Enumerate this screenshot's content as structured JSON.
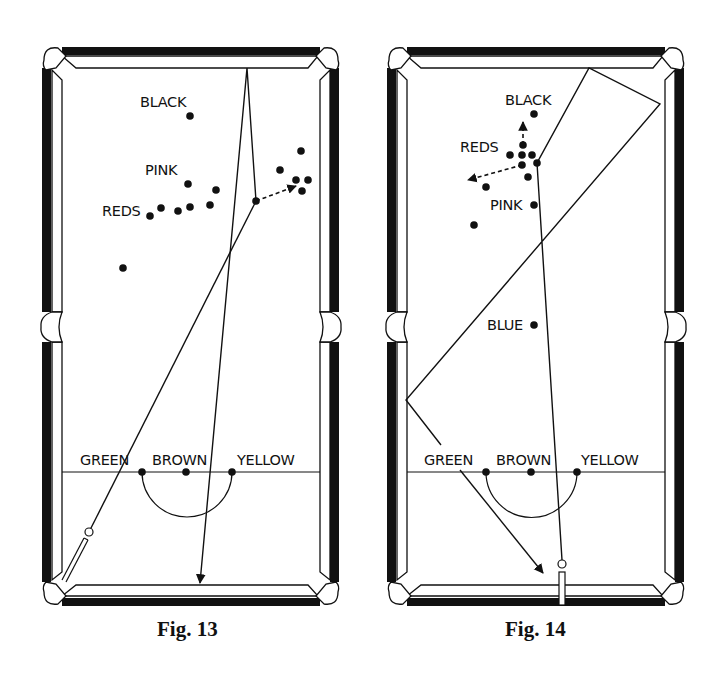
{
  "figures": [
    {
      "caption": "Fig. 13",
      "labels": {
        "black": "BLACK",
        "pink": "PINK",
        "reds": "REDS",
        "green": "GREEN",
        "brown": "BROWN",
        "yellow": "YELLOW"
      },
      "balls": {
        "black": [
          190,
          116
        ],
        "pink": [
          188,
          184
        ],
        "green": [
          142,
          472
        ],
        "brown": [
          186,
          472
        ],
        "yellow": [
          232,
          472
        ],
        "cue_contact": [
          256,
          201
        ],
        "reds": [
          [
            150,
            216
          ],
          [
            161,
            208
          ],
          [
            178,
            211
          ],
          [
            190,
            207
          ],
          [
            210,
            205
          ],
          [
            216,
            190
          ],
          [
            280,
            170
          ],
          [
            301,
            151
          ],
          [
            296,
            180
          ],
          [
            308,
            180
          ],
          [
            302,
            191
          ],
          [
            123,
            268
          ]
        ]
      },
      "cue_ball": [
        89,
        532
      ],
      "paths": {
        "cue_ball_path": [
          [
            89,
            532
          ],
          [
            256,
            201
          ]
        ],
        "object_ball_path": [
          [
            256,
            201
          ],
          [
            247,
            68
          ],
          [
            200,
            583
          ]
        ],
        "deflection_dashed": [
          [
            256,
            201
          ],
          [
            296,
            186
          ]
        ]
      }
    },
    {
      "caption": "Fig. 14",
      "labels": {
        "black": "BLACK",
        "pink": "PINK",
        "reds": "REDS",
        "blue": "BLUE",
        "green": "GREEN",
        "brown": "BROWN",
        "yellow": "YELLOW"
      },
      "balls": {
        "black": [
          534,
          114
        ],
        "pink": [
          534,
          205
        ],
        "blue": [
          534,
          325
        ],
        "green": [
          486,
          472
        ],
        "brown": [
          531,
          472
        ],
        "yellow": [
          577,
          472
        ],
        "cue_contact": [
          537,
          163
        ],
        "reds": [
          [
            523,
            145
          ],
          [
            510,
            155
          ],
          [
            522,
            155
          ],
          [
            532,
            155
          ],
          [
            522,
            165
          ],
          [
            528,
            177
          ],
          [
            486,
            187
          ],
          [
            474,
            225
          ]
        ]
      },
      "cue_ball": [
        562,
        564
      ],
      "paths": {
        "cue_ball_path": [
          [
            562,
            564
          ],
          [
            537,
            163
          ],
          [
            589,
            68
          ],
          [
            660,
            104
          ],
          [
            406,
            400
          ],
          [
            543,
            573
          ]
        ],
        "up_dashed": [
          [
            523,
            145
          ],
          [
            523,
            122
          ]
        ],
        "left_dashed": [
          [
            522,
            165
          ],
          [
            468,
            180
          ]
        ]
      }
    }
  ]
}
